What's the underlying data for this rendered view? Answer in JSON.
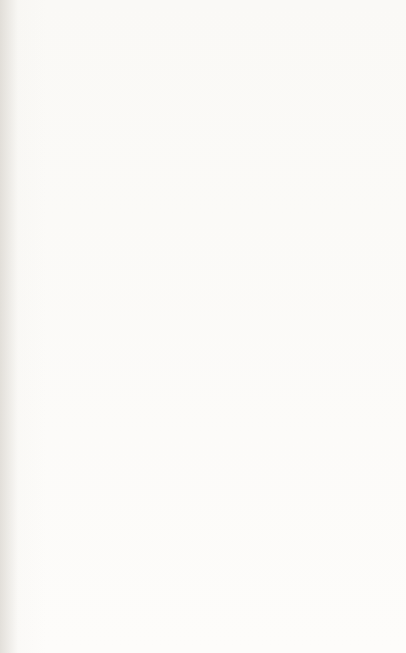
{
  "figure": {
    "caption": "Figure 4.1:  Outline for Formulating Energy-Related Policy Alternatives"
  },
  "diagram": {
    "type": "flow-diagram",
    "orientation": "rotated-90-ccw",
    "nodes": [
      {
        "id": "catalogue-of-possible-policy-actions",
        "lines": [
          "“Catalogue” of",
          "Possible Policy",
          "Actions"
        ]
      },
      {
        "id": "measures-for-assessing-impacts",
        "lines": [
          "Measures for Assessing",
          "Impacts of",
          "Each Policy Action"
        ]
      },
      {
        "id": "determination-of-values",
        "lines": [
          "Determination of Values of",
          "Each Measure For Each",
          "Policy Action"
        ]
      },
      {
        "id": "multicriterion-scoring-actions",
        "lines": [
          "Multicriterion Scoring System",
          "(aggregative rules for evaluation",
          "of worth of actions",
          "or sets of actions)"
        ]
      },
      {
        "id": "requirements-for-energy-services",
        "lines": [
          "Requirements for",
          "Energy-related Services",
          "and Energy Services"
        ]
      },
      {
        "id": "relating-each-policy-action",
        "lines": [
          "Relating Each Policy Action",
          "and Its Relevant Measure(s)",
          "To One or More Societal and",
          "Energy Goals"
        ]
      },
      {
        "id": "hierarchy-of-societal-goals",
        "lines": [
          "Hierarchy",
          "of",
          "Societal Goals"
        ]
      },
      {
        "id": "hierarchy-of-energy-goals",
        "lines": [
          "Hierarchy",
          "of",
          "Energy Goals"
        ]
      },
      {
        "id": "criteria-and-measures",
        "lines": [
          "Criteria and Measures for",
          "Assessing Attainment of",
          "Each Societal and Energy Goal"
        ]
      },
      {
        "id": "multicriterion-scoring-goals",
        "lines": [
          "Multicriterion Scoring System",
          "(Aggregative Rules for Evaluation",
          "of Achievement of Goals",
          "or sets of Goals)"
        ]
      }
    ]
  },
  "colors": {
    "ink": "#15140f",
    "paper": "#fbfaf8",
    "gutter": "#b9b4ac"
  }
}
